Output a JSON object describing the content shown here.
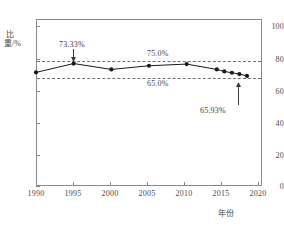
{
  "chart_data": {
    "type": "line",
    "title": "",
    "xlabel": "年份",
    "ylabel": "比重/%",
    "xlim": [
      1990,
      2020
    ],
    "ylim": [
      0,
      100
    ],
    "grid": false,
    "legend": false,
    "x_ticks": [
      "1990",
      "1995",
      "2000",
      "2005",
      "2010",
      "2015",
      "2020"
    ],
    "y_ticks": [
      "0",
      "20",
      "40",
      "60",
      "80",
      "100"
    ],
    "series": [
      {
        "name": "比重",
        "marker": "filled-circle",
        "color": "#1a1a1a",
        "x": [
          1990,
          1995,
          2000,
          2005,
          2010,
          2014,
          2015,
          2016,
          2017,
          2018
        ],
        "values": [
          68.0,
          73.33,
          69.8,
          72.0,
          73.0,
          69.8,
          68.6,
          67.8,
          67.0,
          65.93
        ]
      }
    ],
    "reference_lines": [
      {
        "name": "upper-threshold",
        "value": 75.0,
        "label": "75.0%",
        "label_position": "above",
        "style": "dashed"
      },
      {
        "name": "lower-threshold",
        "value": 65.0,
        "label": "65.0%",
        "label_position": "below",
        "style": "dashed"
      }
    ],
    "annotations": [
      {
        "name": "peak-annotation",
        "text": "73.33%",
        "x": 1995,
        "y": 73.33,
        "arrow": "down"
      },
      {
        "name": "last-annotation",
        "text": "65.93%",
        "x": 2018,
        "y": 65.93,
        "arrow": "up"
      }
    ]
  },
  "axes": {
    "y_label": "比重/%",
    "x_label": "年份",
    "y_ticks": [
      "100",
      "80",
      "60",
      "40",
      "20",
      "0"
    ],
    "x_ticks": [
      "1990",
      "1995",
      "2000",
      "2005",
      "2010",
      "2015",
      "2020"
    ]
  },
  "reference_labels": {
    "upper": "75.0%",
    "lower": "65.0%"
  },
  "annotations": {
    "peak": "73.33%",
    "last": "65.93%"
  },
  "colors": {
    "line": "#1a1a1a",
    "marker": "#1a1a1a",
    "frame": "#8a8a8a",
    "dashed": "#707070",
    "text": "#4a4a4a",
    "background": "#ffffff"
  }
}
